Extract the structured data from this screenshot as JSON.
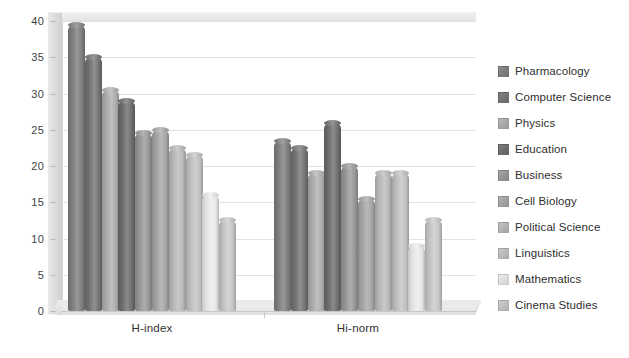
{
  "chart_data": {
    "type": "bar",
    "title": "",
    "subtitle": "",
    "xlabel": "",
    "ylabel": "",
    "categories": [
      "H-index",
      "Hi-norm"
    ],
    "ylim": [
      0,
      40
    ],
    "yticks": [
      0,
      5,
      10,
      15,
      20,
      25,
      30,
      35,
      40
    ],
    "ytick_labels": [
      "0",
      "5",
      "10",
      "15",
      "20",
      "25",
      "30",
      "35",
      "40"
    ],
    "grid": true,
    "legend_position": "right",
    "style": "3d-cylinder-clustered",
    "series": [
      {
        "name": "Pharmacology",
        "color": "#808080",
        "values": [
          39.5,
          23.5
        ]
      },
      {
        "name": "Computer Science",
        "color": "#757575",
        "values": [
          35.0,
          22.5
        ]
      },
      {
        "name": "Physics",
        "color": "#b0b0b0",
        "values": [
          30.5,
          19.0
        ]
      },
      {
        "name": "Education",
        "color": "#6e6e6e",
        "values": [
          29.0,
          26.0
        ]
      },
      {
        "name": "Business",
        "color": "#9a9a9a",
        "values": [
          24.5,
          20.0
        ]
      },
      {
        "name": "Cell Biology",
        "color": "#a8a8a8",
        "values": [
          25.0,
          15.5
        ]
      },
      {
        "name": "Political Science",
        "color": "#bcbcbc",
        "values": [
          22.5,
          19.0
        ]
      },
      {
        "name": "Linguistics",
        "color": "#c4c4c4",
        "values": [
          21.5,
          19.0
        ]
      },
      {
        "name": "Mathematics",
        "color": "#ececec",
        "values": [
          16.0,
          9.0
        ]
      },
      {
        "name": "Cinema Studies",
        "color": "#c9c9c9",
        "values": [
          12.5,
          12.5
        ]
      }
    ]
  },
  "legend": {
    "items": [
      {
        "label": "Pharmacology"
      },
      {
        "label": "Computer Science"
      },
      {
        "label": "Physics"
      },
      {
        "label": "Education"
      },
      {
        "label": "Business"
      },
      {
        "label": "Cell Biology"
      },
      {
        "label": "Political Science"
      },
      {
        "label": "Linguistics"
      },
      {
        "label": "Mathematics"
      },
      {
        "label": "Cinema Studies"
      }
    ]
  },
  "axes": {
    "y_tick_labels": [
      "40",
      "35",
      "30",
      "25",
      "20",
      "15",
      "10",
      "5",
      "0"
    ],
    "x_tick_labels": [
      "H-index",
      "Hi-norm"
    ]
  }
}
